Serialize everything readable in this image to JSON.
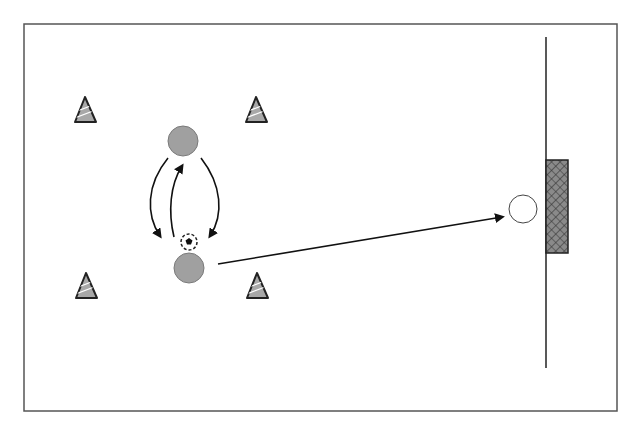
{
  "diagram": {
    "type": "soccer-drill",
    "colors": {
      "background": "#ffffff",
      "border": "#555555",
      "player_fill": "#a0a0a0",
      "player_stroke": "#7a7a7a",
      "target_fill": "#ffffff",
      "target_stroke": "#444444",
      "cone_fill": "#a8a8a8",
      "cone_stroke": "#222222",
      "goal_fill": "#8a8a8a",
      "goal_stroke": "#222222",
      "line": "#111111"
    },
    "field_boundary": {
      "x": 24,
      "y": 24,
      "width": 593,
      "height": 387
    },
    "goal_line": {
      "x": 546,
      "y1": 37,
      "y2": 368
    },
    "goal": {
      "x": 546,
      "y": 160,
      "width": 22,
      "height": 93
    },
    "cones": [
      {
        "id": "top-left",
        "apex_x": 85,
        "apex_y": 97,
        "base_y": 122
      },
      {
        "id": "top-right",
        "apex_x": 256,
        "apex_y": 97,
        "base_y": 122
      },
      {
        "id": "bottom-left",
        "apex_x": 86,
        "apex_y": 273,
        "base_y": 298
      },
      {
        "id": "bottom-right",
        "apex_x": 257,
        "apex_y": 273,
        "base_y": 298
      }
    ],
    "players": [
      {
        "id": "player-top",
        "cx": 183,
        "cy": 141,
        "r": 15
      },
      {
        "id": "player-bottom",
        "cx": 189,
        "cy": 268,
        "r": 15
      }
    ],
    "target": {
      "id": "target-player",
      "cx": 523,
      "cy": 209,
      "r": 14
    },
    "ball": {
      "cx": 189,
      "cy": 242,
      "r": 8
    },
    "arrows": [
      {
        "id": "run-left",
        "path": "M168,158 C146,185 146,215 160,236"
      },
      {
        "id": "pass-up",
        "path": "M174,237 C168,212 170,185 182,166"
      },
      {
        "id": "run-right",
        "path": "M201,158 C222,185 224,215 210,236"
      },
      {
        "id": "shot",
        "path": "M218,264 L502,217"
      }
    ]
  }
}
